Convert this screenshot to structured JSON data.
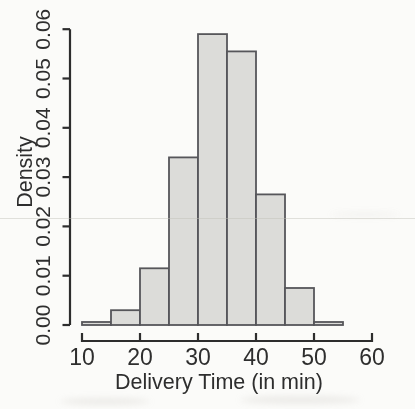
{
  "figure": {
    "background": "#fbfbf9",
    "kind": "scanned textbook histogram"
  },
  "chart_data": {
    "type": "bar",
    "subtype": "histogram",
    "title": "",
    "xlabel": "Delivery Time (in min)",
    "ylabel": "Density",
    "bin_width": 5,
    "bin_edges": [
      10,
      15,
      20,
      25,
      30,
      35,
      40,
      45,
      50,
      55
    ],
    "categories": [
      "10-15",
      "15-20",
      "20-25",
      "25-30",
      "30-35",
      "35-40",
      "40-45",
      "45-50",
      "50-55"
    ],
    "values": [
      0.0006,
      0.003,
      0.0115,
      0.034,
      0.059,
      0.0555,
      0.0265,
      0.0075,
      0.0006
    ],
    "x_ticks": [
      {
        "value": 10,
        "label": "10"
      },
      {
        "value": 20,
        "label": "20"
      },
      {
        "value": 30,
        "label": "30"
      },
      {
        "value": 40,
        "label": "40"
      },
      {
        "value": 50,
        "label": "50"
      },
      {
        "value": 60,
        "label": "60"
      }
    ],
    "y_ticks": [
      {
        "value": 0.0,
        "label": "0.00"
      },
      {
        "value": 0.01,
        "label": "0.01"
      },
      {
        "value": 0.02,
        "label": "0.02"
      },
      {
        "value": 0.03,
        "label": "0.03"
      },
      {
        "value": 0.04,
        "label": "0.04"
      },
      {
        "value": 0.05,
        "label": "0.05"
      },
      {
        "value": 0.06,
        "label": "0.06"
      }
    ],
    "xlim": [
      10,
      60
    ],
    "ylim": [
      0,
      0.06
    ],
    "grid": false,
    "legend": null,
    "colors": {
      "bar_fill": "#dcdcd9",
      "bar_stroke": "#56565a",
      "axis": "#2d2d2d",
      "text": "#2e2e2e"
    }
  }
}
